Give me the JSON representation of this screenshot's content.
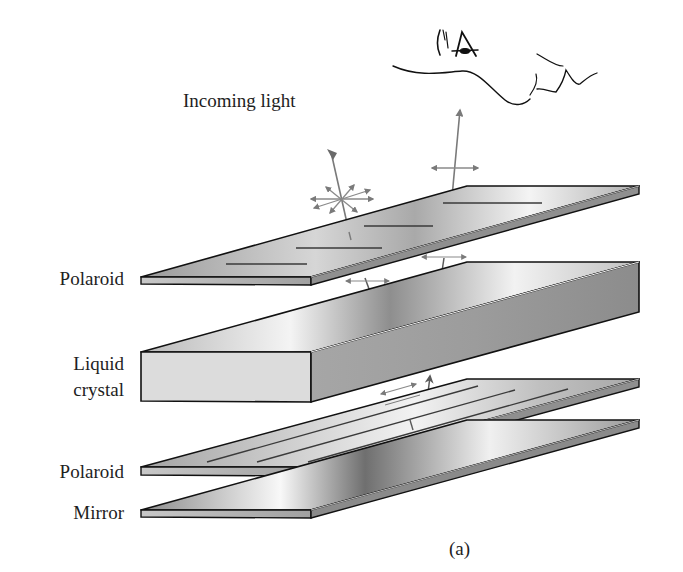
{
  "figure": {
    "caption": "(a)"
  },
  "labels": {
    "incoming_light": "Incoming light",
    "top_polaroid": "Polaroid",
    "liquid_crystal_line1": "Liquid",
    "liquid_crystal_line2": "crystal",
    "bottom_polaroid": "Polaroid",
    "mirror": "Mirror"
  },
  "layers": [
    {
      "name": "Polaroid",
      "position": "top",
      "polarization_lines": "horizontal"
    },
    {
      "name": "Liquid crystal",
      "position": "middle"
    },
    {
      "name": "Polaroid",
      "position": "lower",
      "polarization_lines": "diagonal"
    },
    {
      "name": "Mirror",
      "position": "bottom"
    }
  ],
  "colors": {
    "outline": "#111111",
    "arrow": "#7a7a7a",
    "plate_light": "#f2f2f2",
    "plate_mid": "#c4c4c4",
    "plate_dark": "#8a8a8a",
    "text": "#1e1e1e"
  }
}
